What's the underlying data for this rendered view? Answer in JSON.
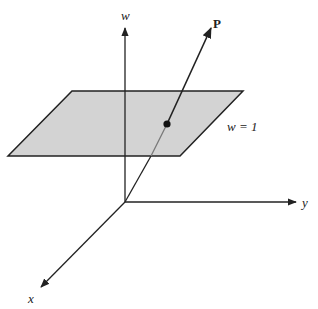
{
  "diagram": {
    "axes": {
      "w": {
        "label": "w",
        "origin": [
          125,
          202
        ],
        "end": [
          125,
          26
        ]
      },
      "y": {
        "label": "y",
        "origin": [
          125,
          202
        ],
        "end": [
          297,
          202
        ]
      },
      "x": {
        "label": "x",
        "origin": [
          125,
          202
        ],
        "end": [
          40,
          288
        ]
      }
    },
    "plane": {
      "label": "w = 1",
      "fill": "#d3d3d3",
      "stroke": "#222222",
      "corners": [
        [
          72,
          91
        ],
        [
          243,
          91
        ],
        [
          180,
          156
        ],
        [
          8,
          156
        ]
      ]
    },
    "ray": {
      "label": "P",
      "from": [
        125,
        202
      ],
      "to": [
        212,
        26
      ],
      "intersection": [
        167,
        124
      ]
    },
    "colors": {
      "line": "#222222",
      "behind_line": "#777777"
    }
  }
}
